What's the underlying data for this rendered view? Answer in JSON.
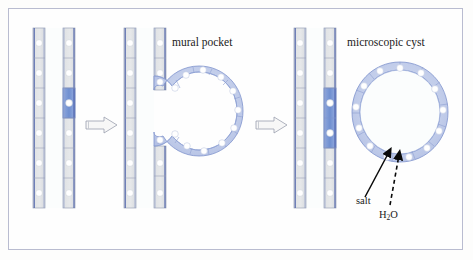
{
  "figure": {
    "type": "diagram",
    "background_color": "#fefefe",
    "frame_border_color": "#b9bcd0"
  },
  "labels": {
    "mural_pocket": "mural pocket",
    "microscopic_cyst": "microscopic cyst",
    "salt": "salt",
    "water_pre": "H",
    "water_sub": "2",
    "water_post": "O"
  },
  "palette": {
    "cell_fill": "#e2e4e6",
    "cell_fill_highlight": "#7d9ad6",
    "cell_fill_ring": "#c3cdea",
    "cell_stroke": "#9aa3b8",
    "wall_line": "#4a5fa8",
    "nucleus": "#ffffff",
    "lumen": "#fbfdfd",
    "arrow_outline_fill": "#f7f7f7",
    "arrow_outline_stroke": "#9aa0ae",
    "transport_arrow": "#0a0a0a"
  },
  "panels": [
    {
      "id": "panel-normal",
      "name": "normal-tubule",
      "caption": "",
      "cells_per_wall": 6,
      "walls": [
        {
          "side": "left",
          "x": 33,
          "highlighted_cells": []
        },
        {
          "side": "right",
          "x": 63,
          "highlighted_cells": [
            2
          ]
        }
      ]
    },
    {
      "id": "panel-pocket",
      "name": "mural-pocket",
      "caption": "mural pocket",
      "cells_per_wall": 6,
      "walls": [
        {
          "side": "left",
          "x": 124,
          "highlighted_cells": []
        },
        {
          "side": "right",
          "x": 154,
          "highlighted_cells": []
        }
      ],
      "pocket": {
        "ring_cells": 13,
        "opening": "tubule-lumen"
      }
    },
    {
      "id": "panel-cyst",
      "name": "microscopic-cyst",
      "caption": "microscopic cyst",
      "cells_per_wall": 6,
      "walls": [
        {
          "side": "left",
          "x": 294,
          "highlighted_cells": []
        },
        {
          "side": "right",
          "x": 324,
          "highlighted_cells": [
            2,
            3
          ]
        }
      ],
      "cyst": {
        "ring_cells": 13,
        "detached": true
      }
    }
  ],
  "transitions": [
    {
      "name": "arrow-normal-to-pocket",
      "from": "panel-normal",
      "to": "panel-pocket",
      "style": "outlined-block-arrow"
    },
    {
      "name": "arrow-pocket-to-cyst",
      "from": "panel-pocket",
      "to": "panel-cyst",
      "style": "outlined-block-arrow"
    }
  ],
  "transport": [
    {
      "name": "salt-arrow",
      "label": "salt",
      "line_style": "solid",
      "direction": "into-cyst-lumen"
    },
    {
      "name": "water-arrow",
      "label": "H2O",
      "line_style": "dashed",
      "direction": "into-cyst-lumen"
    }
  ]
}
